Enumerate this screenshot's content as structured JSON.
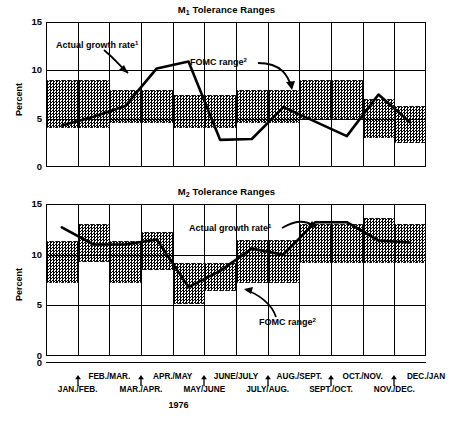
{
  "figure": {
    "year_label": "1976",
    "y_axis_label": "Percent",
    "y_ticks": [
      "15",
      "10",
      "5",
      "0"
    ],
    "zero_label": "0",
    "annotation_actual": "Actual growth rate",
    "annotation_actual_sup": "1",
    "annotation_fomc": "FOMC range",
    "annotation_fomc_sup": "2",
    "x_labels_upper": [
      "FEB./MAR.",
      "APR./MAY",
      "JUNE/JULY",
      "AUG./SEPT.",
      "OCT./NOV.",
      "DEC./JAN"
    ],
    "x_labels_lower": [
      "JAN./FEB.",
      "MAR./APR.",
      "MAY/JUNE",
      "JULY/AUG.",
      "SEPT./OCT.",
      "NOV./DEC."
    ],
    "ink_color": "#000000",
    "band_color": "#000000",
    "background": "#ffffff"
  },
  "chart_data": [
    {
      "type": "line",
      "title": "M₁ Tolerance Ranges",
      "title_base": "M",
      "title_sub": "1",
      "title_rest": " Tolerance Ranges",
      "xlabel": "1976",
      "ylabel": "Percent",
      "ylim": [
        0,
        15
      ],
      "yticks": [
        0,
        5,
        10,
        15
      ],
      "grid": true,
      "legend": "annotations",
      "periods": [
        "JAN./FEB.",
        "FEB./MAR.",
        "MAR./APR.",
        "APR./MAY",
        "MAY/JUNE",
        "JUNE/JULY",
        "JULY/AUG.",
        "AUG./SEPT.",
        "SEPT./OCT.",
        "OCT./NOV.",
        "NOV./DEC.",
        "DEC./JAN"
      ],
      "series": [
        {
          "name": "Actual growth rate",
          "values": [
            4.3,
            5.2,
            6.3,
            10.2,
            10.9,
            2.8,
            2.9,
            6.2,
            4.7,
            3.2,
            7.5,
            4.6
          ]
        }
      ],
      "fomc_ranges": [
        {
          "period": "JAN./FEB.",
          "low": 4.0,
          "high": 9.0
        },
        {
          "period": "FEB./MAR.",
          "low": 4.0,
          "high": 9.0
        },
        {
          "period": "MAR./APR.",
          "low": 4.5,
          "high": 8.0
        },
        {
          "period": "APR./MAY",
          "low": 4.5,
          "high": 8.0
        },
        {
          "period": "MAY/JUNE",
          "low": 4.0,
          "high": 7.5
        },
        {
          "period": "JUNE/JULY",
          "low": 4.0,
          "high": 7.5
        },
        {
          "period": "JULY/AUG.",
          "low": 4.5,
          "high": 8.0
        },
        {
          "period": "AUG./SEPT.",
          "low": 4.5,
          "high": 8.0
        },
        {
          "period": "SEPT./OCT.",
          "low": 5.0,
          "high": 9.0
        },
        {
          "period": "OCT./NOV.",
          "low": 5.0,
          "high": 9.0
        },
        {
          "period": "NOV./DEC.",
          "low": 3.0,
          "high": 7.0
        },
        {
          "period": "DEC./JAN",
          "low": 2.5,
          "high": 6.3
        }
      ]
    },
    {
      "type": "line",
      "title": "M₂ Tolerance Ranges",
      "title_base": "M",
      "title_sub": "2",
      "title_rest": " Tolerance Ranges",
      "xlabel": "1976",
      "ylabel": "Percent",
      "ylim": [
        0,
        15
      ],
      "yticks": [
        0,
        5,
        10,
        15
      ],
      "grid": true,
      "legend": "annotations",
      "periods": [
        "JAN./FEB.",
        "FEB./MAR.",
        "MAR./APR.",
        "APR./MAY",
        "MAY/JUNE",
        "JUNE/JULY",
        "JULY/AUG.",
        "AUG./SEPT.",
        "SEPT./OCT.",
        "OCT./NOV.",
        "NOV./DEC.",
        "DEC./JAN"
      ],
      "series": [
        {
          "name": "Actual growth rate",
          "values": [
            12.7,
            11.0,
            11.0,
            11.5,
            6.8,
            8.4,
            10.6,
            10.0,
            13.2,
            13.2,
            11.4,
            11.2
          ]
        }
      ],
      "fomc_ranges": [
        {
          "period": "JAN./FEB.",
          "low": 7.2,
          "high": 11.3
        },
        {
          "period": "FEB./MAR.",
          "low": 9.3,
          "high": 13.0
        },
        {
          "period": "MAR./APR.",
          "low": 7.2,
          "high": 11.3
        },
        {
          "period": "APR./MAY",
          "low": 8.5,
          "high": 12.2
        },
        {
          "period": "MAY/JUNE",
          "low": 5.1,
          "high": 9.2
        },
        {
          "period": "JUNE/JULY",
          "low": 6.4,
          "high": 9.2
        },
        {
          "period": "JULY/AUG.",
          "low": 7.2,
          "high": 11.4
        },
        {
          "period": "AUG./SEPT.",
          "low": 7.2,
          "high": 11.4
        },
        {
          "period": "SEPT./OCT.",
          "low": 9.2,
          "high": 13.0
        },
        {
          "period": "OCT./NOV.",
          "low": 9.2,
          "high": 13.0
        },
        {
          "period": "NOV./DEC.",
          "low": 9.2,
          "high": 13.6
        },
        {
          "period": "DEC./JAN",
          "low": 9.2,
          "high": 13.0
        }
      ]
    }
  ]
}
